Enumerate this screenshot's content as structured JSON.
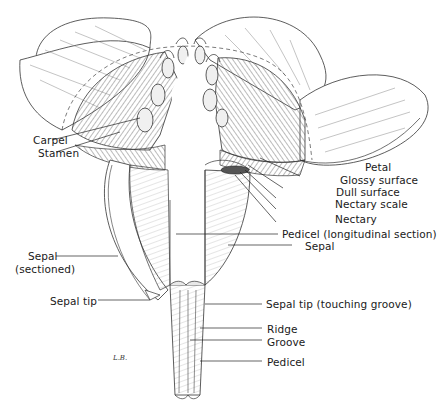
{
  "diagram": {
    "signature": "L.B.",
    "labels_left": [
      {
        "id": "carpel",
        "text": "Carpel"
      },
      {
        "id": "stamen",
        "text": "Stamen"
      },
      {
        "id": "sepal_sectioned_1",
        "text": "Sepal"
      },
      {
        "id": "sepal_sectioned_2",
        "text": "(sectioned)"
      },
      {
        "id": "sepal_tip",
        "text": "Sepal tip"
      }
    ],
    "labels_right": [
      {
        "id": "petal",
        "text": "Petal"
      },
      {
        "id": "glossy_surface",
        "text": "Glossy surface"
      },
      {
        "id": "dull_surface",
        "text": "Dull surface"
      },
      {
        "id": "nectary_scale",
        "text": "Nectary scale"
      },
      {
        "id": "nectary",
        "text": "Nectary"
      },
      {
        "id": "pedicel_long",
        "text": "Pedicel (longitudinal section)"
      },
      {
        "id": "sepal",
        "text": "Sepal"
      },
      {
        "id": "sepal_tip_touching",
        "text": "Sepal tip (touching groove)"
      },
      {
        "id": "ridge",
        "text": "Ridge"
      },
      {
        "id": "groove",
        "text": "Groove"
      },
      {
        "id": "pedicel",
        "text": "Pedicel"
      }
    ],
    "colors": {
      "ink": "#2a2a2a",
      "shade": "#d9d9d9",
      "background": "#ffffff"
    }
  }
}
